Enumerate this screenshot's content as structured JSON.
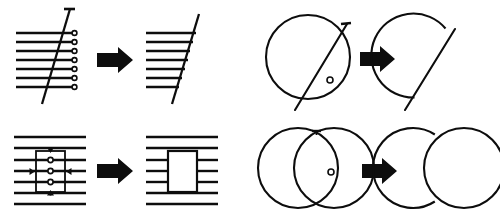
{
  "figure": {
    "background_color": "#ffffff",
    "ink_color": "#0d0d0d",
    "width": 500,
    "height": 221,
    "panel_count": 4,
    "arrow_glyph": "solid-right-arrow"
  },
  "panels": [
    {
      "id": "panel-lines-diagonal",
      "position": "top-left",
      "caption": "",
      "before": {
        "label": "seven horizontal lines crossed by a diagonal cutting line",
        "horizontal_line_count": 7,
        "endpoint_marker": "circle",
        "cutting_line": "diagonal",
        "cutting_line_cap": "tee"
      },
      "after": {
        "label": "horizontal lines trimmed at the diagonal",
        "horizontal_line_count": 7,
        "cutting_line": "diagonal"
      }
    },
    {
      "id": "panel-lines-rectangle",
      "position": "bottom-left",
      "caption": "",
      "before": {
        "label": "seven horizontal lines with a rectangular trim boundary",
        "horizontal_line_count": 7,
        "boundary_shape": "rectangle",
        "boundary_markers": "four edge arrow caps",
        "interior_marker_count": 3,
        "interior_marker": "circle"
      },
      "after": {
        "label": "middle lines trimmed inside the rectangle",
        "horizontal_line_count": 7,
        "boundary_shape": "rectangle",
        "trimmed_line_count": 3
      }
    },
    {
      "id": "panel-circle-line",
      "position": "top-right",
      "caption": "",
      "before": {
        "label": "circle crossed by a diagonal chord line",
        "shape": "circle",
        "cutting_line": "diagonal",
        "cutting_line_cap": "tee",
        "intersection_marker": "circle",
        "intersection_marker_count": 1
      },
      "after": {
        "label": "circle arc right of the chord removed",
        "shape": "circle-trimmed",
        "cutting_line": "diagonal"
      }
    },
    {
      "id": "panel-two-circles",
      "position": "bottom-right",
      "caption": "",
      "before": {
        "label": "two overlapping circles",
        "shape_count": 2,
        "shape": "circle",
        "overlap": true,
        "arc_cap": "tee",
        "intersection_marker": "circle",
        "intersection_marker_count": 1
      },
      "after": {
        "label": "overlapping arc of the left circle removed",
        "shape_count": 2,
        "shape": "circle",
        "overlap": true
      }
    }
  ]
}
